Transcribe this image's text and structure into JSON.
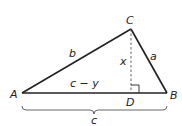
{
  "diagram": {
    "vertices": {
      "A": {
        "label": "A",
        "x": 22,
        "y": 93
      },
      "B": {
        "label": "B",
        "x": 167,
        "y": 93
      },
      "C": {
        "label": "C",
        "x": 131,
        "y": 29
      },
      "D": {
        "label": "D",
        "x": 131,
        "y": 93
      }
    },
    "side_labels": {
      "b": "b",
      "a": "a",
      "x": "x",
      "c_minus_y": "c − y",
      "c": "c"
    },
    "colors": {
      "stroke": "#222222",
      "dashed": "#555555"
    }
  }
}
